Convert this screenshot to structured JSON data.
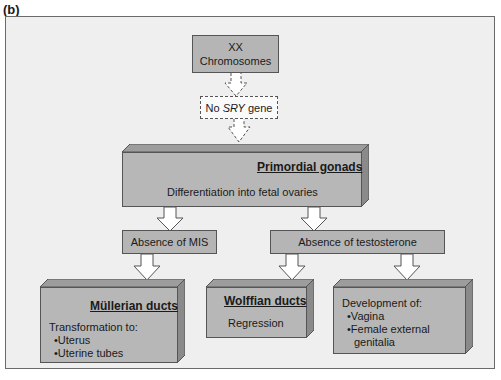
{
  "figure_label": "(b)",
  "nodes": {
    "xx": {
      "line1": "XX",
      "line2": "Chromosomes"
    },
    "sry": {
      "prefix": "No ",
      "gene": "SRY",
      "suffix": " gene"
    },
    "gonads": {
      "title": "Primordial gonads",
      "text": "Differentiation into fetal ovaries"
    },
    "mis": {
      "label": "Absence of MIS"
    },
    "testosterone": {
      "label": "Absence of testosterone"
    },
    "mullerian": {
      "title": "Müllerian ducts",
      "text": "Transformation to:",
      "items": [
        "Uterus",
        "Uterine tubes"
      ]
    },
    "wolffian": {
      "title": "Wolffian ducts",
      "text": "Regression"
    },
    "development": {
      "text": "Development of:",
      "items": [
        "Vagina",
        "Female external",
        "genitalia"
      ]
    }
  },
  "colors": {
    "box_fill": "#b5b5b5",
    "panel": "#efefef",
    "dark_side": "#8a8a8a",
    "top_side": "#9d9d9d"
  }
}
